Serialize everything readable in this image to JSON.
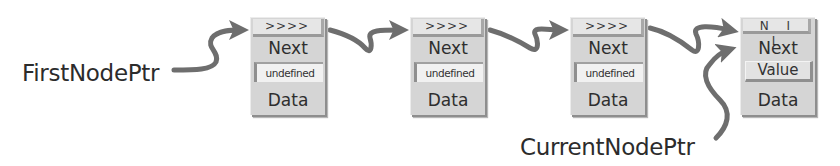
{
  "diagram": {
    "type": "linked-list",
    "colors": {
      "arrow": "#6e6e6e",
      "node_body": "#d5d5d5",
      "node_header": "#e6e6e6",
      "node_shadow": "#8e8e8e",
      "text": "#2c2c2c"
    },
    "pointers": {
      "first": {
        "label": "FirstNodePtr",
        "points_to_node": 0
      },
      "current": {
        "label": "CurrentNodePtr",
        "points_to_node": 3
      }
    },
    "nodes": [
      {
        "header": ">>>>",
        "next_label": "Next",
        "field": "undefined",
        "data_label": "Data"
      },
      {
        "header": ">>>>",
        "next_label": "Next",
        "field": "undefined",
        "data_label": "Data"
      },
      {
        "header": ">>>>",
        "next_label": "Next",
        "field": "undefined",
        "data_label": "Data"
      },
      {
        "header": "N I L",
        "next_label": "Next",
        "field": "Value",
        "data_label": "Data"
      }
    ],
    "links": [
      {
        "from": "FirstNodePtr",
        "to": "node-0"
      },
      {
        "from": "node-0",
        "to": "node-1"
      },
      {
        "from": "node-1",
        "to": "node-2"
      },
      {
        "from": "node-2",
        "to": "node-3"
      },
      {
        "from": "CurrentNodePtr",
        "to": "node-3"
      }
    ]
  }
}
